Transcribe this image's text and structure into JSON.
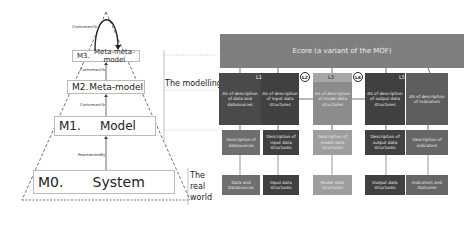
{
  "pyramid": {
    "levels": [
      {
        "code": "M3.",
        "name": "Meta-meta-model"
      },
      {
        "code": "M2.",
        "name": "Meta-model"
      },
      {
        "code": "M1.",
        "name": "Model"
      },
      {
        "code": "M0.",
        "name": "System"
      }
    ],
    "relations": {
      "m3_self": "ConformantTo",
      "m2_m3": "ConformantTo",
      "m1_m2": "ConformantTo",
      "m0_m1": "RepresentedBy"
    }
  },
  "worlds": {
    "modelling": "The modelling world",
    "real": "The real world"
  },
  "ecore": {
    "label": "Ecore (a variant of the MOF)"
  },
  "layers": {
    "L1": "L1",
    "L2": "L2",
    "L3": "L3",
    "L4": "L4",
    "L5": "L5"
  },
  "metamodels": [
    "AS of description of data and datasources",
    "AS of description of input data structures",
    "AS of description of model data structures",
    "AS of description of output data structures",
    "AS of description of indicators"
  ],
  "models": [
    "Description of datasources",
    "Description of input data structures",
    "Description of model data structures",
    "Description of output data structures",
    "Description of indicators"
  ],
  "systems": [
    "Data and Datasources",
    "Input data structures",
    "Model data structures",
    "Output data structures",
    "Indicators and Outcome"
  ]
}
